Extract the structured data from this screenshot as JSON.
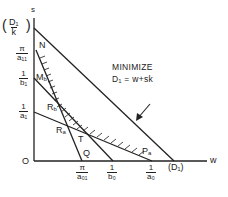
{
  "diagram": {
    "title": "MINIMIZE",
    "objective": "D₁ = w+sk",
    "axes": {
      "x_label": "w",
      "y_label": "s",
      "origin_label": "O"
    },
    "y_axis_ticks": [
      {
        "id": "D1k",
        "num": "D₁",
        "den": "k",
        "parenthesized": true
      },
      {
        "id": "pi_a11",
        "num": "π",
        "den": "a₁₁"
      },
      {
        "id": "one_b1",
        "num": "1",
        "den": "b₁"
      },
      {
        "id": "one_a1",
        "num": "1",
        "den": "a₁"
      }
    ],
    "x_axis_ticks": [
      {
        "id": "pi_a01",
        "num": "π",
        "den": "a₀₁"
      },
      {
        "id": "one_b0",
        "num": "1",
        "den": "b₀"
      },
      {
        "id": "one_a0",
        "num": "1",
        "den": "a₀"
      },
      {
        "id": "D1",
        "text": "(D₁)"
      }
    ],
    "points": [
      {
        "id": "N",
        "label": "N"
      },
      {
        "id": "Mb",
        "label": "M",
        "sub": "b"
      },
      {
        "id": "Rb",
        "label": "R",
        "sub": "b"
      },
      {
        "id": "Ra",
        "label": "R",
        "sub": "a"
      },
      {
        "id": "T",
        "label": "T"
      },
      {
        "id": "Q",
        "label": "Q"
      },
      {
        "id": "Pa",
        "label": "P",
        "sub": "a"
      }
    ],
    "colors": {
      "ink": "#222222",
      "background": "#ffffff"
    }
  }
}
